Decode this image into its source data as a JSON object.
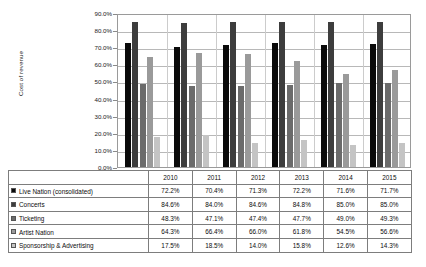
{
  "chart_data": {
    "type": "bar",
    "title": "",
    "subtitle": "",
    "xlabel": "",
    "ylabel": "Cost of revenue",
    "ylim": [
      0,
      90
    ],
    "ytick_labels": [
      "0.0%",
      "10.0%",
      "20.0%",
      "30.0%",
      "40.0%",
      "50.0%",
      "60.0%",
      "70.0%",
      "80.0%",
      "90.0%"
    ],
    "ytick_values": [
      0,
      10,
      20,
      30,
      40,
      50,
      60,
      70,
      80,
      90
    ],
    "grid": true,
    "legend_position": "data-table",
    "categories": [
      "2010",
      "2011",
      "2012",
      "2013",
      "2014",
      "2015"
    ],
    "series": [
      {
        "name": "Live Nation (consolidated)",
        "color": "#0a0a0a",
        "values": [
          72.2,
          70.4,
          71.3,
          72.2,
          71.6,
          71.7
        ],
        "labels": [
          "72.2%",
          "70.4%",
          "71.3%",
          "72.2%",
          "71.6%",
          "71.7%"
        ]
      },
      {
        "name": "Concerts",
        "color": "#3d3d3d",
        "values": [
          84.6,
          84.0,
          84.6,
          84.8,
          85.0,
          85.0
        ],
        "labels": [
          "84.6%",
          "84.0%",
          "84.6%",
          "84.8%",
          "85.0%",
          "85.0%"
        ]
      },
      {
        "name": "Ticketing",
        "color": "#6b6b6b",
        "values": [
          48.3,
          47.1,
          47.4,
          47.7,
          49.0,
          49.3
        ],
        "labels": [
          "48.3%",
          "47.1%",
          "47.4%",
          "47.7%",
          "49.0%",
          "49.3%"
        ]
      },
      {
        "name": "Artist Nation",
        "color": "#9a9a9a",
        "values": [
          64.3,
          66.4,
          66.0,
          61.8,
          54.5,
          56.6
        ],
        "labels": [
          "64.3%",
          "66.4%",
          "66.0%",
          "61.8%",
          "54.5%",
          "56.6%"
        ]
      },
      {
        "name": "Sponsorship & Advertising",
        "color": "#c4c4c4",
        "values": [
          17.5,
          18.5,
          14.0,
          15.8,
          12.6,
          14.3
        ],
        "labels": [
          "17.5%",
          "18.5%",
          "14.0%",
          "15.8%",
          "12.6%",
          "14.3%"
        ]
      }
    ]
  },
  "table": {
    "corner_label": "",
    "column_headers": [
      "2010",
      "2011",
      "2012",
      "2013",
      "2014",
      "2015"
    ],
    "rows": [
      {
        "label": "Live Nation (consolidated)",
        "swatch_color": "#0a0a0a",
        "values": [
          "72.2%",
          "70.4%",
          "71.3%",
          "72.2%",
          "71.6%",
          "71.7%"
        ]
      },
      {
        "label": "Concerts",
        "swatch_color": "#3d3d3d",
        "values": [
          "84.6%",
          "84.0%",
          "84.6%",
          "84.8%",
          "85.0%",
          "85.0%"
        ]
      },
      {
        "label": "Ticketing",
        "swatch_color": "#6b6b6b",
        "values": [
          "48.3%",
          "47.1%",
          "47.4%",
          "47.7%",
          "49.0%",
          "49.3%"
        ]
      },
      {
        "label": "Artist Nation",
        "swatch_color": "#9a9a9a",
        "values": [
          "64.3%",
          "66.4%",
          "66.0%",
          "61.8%",
          "54.5%",
          "56.6%"
        ]
      },
      {
        "label": "Sponsorship & Advertising",
        "swatch_color": "#c4c4c4",
        "values": [
          "17.5%",
          "18.5%",
          "14.0%",
          "15.8%",
          "12.6%",
          "14.3%"
        ]
      }
    ]
  }
}
